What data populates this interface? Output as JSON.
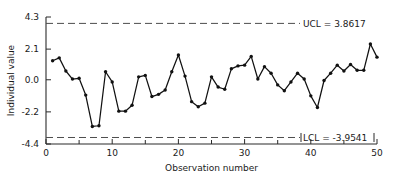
{
  "chart_data": {
    "type": "line",
    "title": "",
    "xlabel": "Observation number",
    "ylabel": "Individual value",
    "xlim": [
      0,
      50
    ],
    "ylim": [
      -4.4,
      4.3
    ],
    "grid": false,
    "legend": "none",
    "x_ticks": [
      0,
      10,
      20,
      30,
      40,
      50
    ],
    "x_tick_labels": [
      "0",
      "10",
      "20",
      "30",
      "40",
      "50"
    ],
    "x_minor_ticks": [
      5,
      15,
      25,
      35,
      45
    ],
    "y_ticks": [
      4.3,
      2.1,
      0.0,
      -2.2,
      -4.4
    ],
    "y_tick_labels": [
      "4.3",
      "2.1",
      "0.0",
      "-2.2",
      "-4.4"
    ],
    "control_limits": {
      "ucl": 3.8617,
      "lcl": -3.9541,
      "ucl_label": "UCL = 3.8617",
      "lcl_label": "LCL = -3.9541"
    },
    "series": [
      {
        "name": "Individual value",
        "x": [
          1,
          2,
          3,
          4,
          5,
          6,
          7,
          8,
          9,
          10,
          11,
          12,
          13,
          14,
          15,
          16,
          17,
          18,
          19,
          20,
          21,
          22,
          23,
          24,
          25,
          26,
          27,
          28,
          29,
          30,
          31,
          32,
          33,
          34,
          35,
          36,
          37,
          38,
          39,
          40,
          41,
          42,
          43,
          44,
          45,
          46,
          47,
          48,
          49,
          50
        ],
        "values": [
          1.3,
          1.5,
          0.6,
          0.05,
          0.1,
          -1.05,
          -3.2,
          -3.15,
          0.55,
          -0.15,
          -2.15,
          -2.15,
          -1.75,
          0.2,
          0.3,
          -1.15,
          -1.0,
          -0.7,
          0.55,
          1.7,
          0.25,
          -1.5,
          -1.85,
          -1.6,
          0.2,
          -0.5,
          -0.65,
          0.75,
          0.95,
          1.0,
          1.6,
          0.05,
          0.9,
          0.45,
          -0.35,
          -0.75,
          -0.15,
          0.45,
          0.05,
          -1.1,
          -1.9,
          -0.05,
          0.45,
          1.0,
          0.6,
          1.05,
          0.65,
          0.65,
          2.45,
          1.55
        ]
      }
    ]
  },
  "labels": {
    "y_axis_title": "Individual value",
    "x_axis_title": "Observation number",
    "ucl_text": "UCL = 3.8617",
    "lcl_text": "LCL = -3.9541"
  },
  "colors": {
    "line": "#111111",
    "point": "#111111",
    "axis": "#2b2b2b",
    "limit": "#4d4d4d",
    "background": "#ffffff"
  }
}
